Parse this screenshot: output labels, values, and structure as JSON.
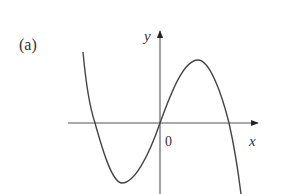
{
  "figure": {
    "panel_label": "(a)",
    "y_axis_label": "y",
    "x_axis_label": "x",
    "origin_label": "0",
    "curve_description": "cubic with negative leading coefficient: local minimum left of origin, passes through origin, local maximum right of origin",
    "colors": {
      "stroke": "#444444",
      "text": "#333333",
      "background": "#ffffff"
    }
  }
}
